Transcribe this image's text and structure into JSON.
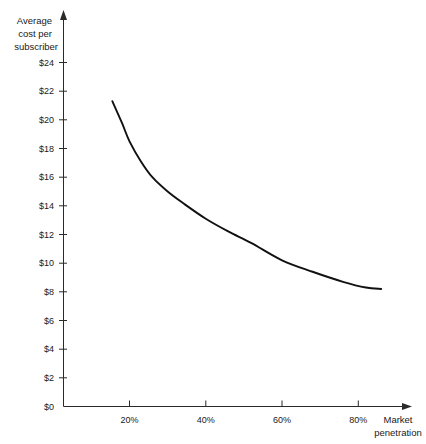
{
  "chart_data": {
    "type": "line",
    "title": "",
    "xlabel": "Market penetration",
    "ylabel": "Average cost per subscriber",
    "ylabel_lines": [
      "Average",
      "cost per",
      "subscriber"
    ],
    "xlabel_lines": [
      "Market",
      "penetration"
    ],
    "xlim": [
      0,
      90
    ],
    "ylim": [
      0,
      24
    ],
    "grid": false,
    "legend": null,
    "x_tick_labels": [
      "20%",
      "40%",
      "60%",
      "80%"
    ],
    "x_tick_values": [
      20,
      40,
      60,
      80
    ],
    "y_tick_labels": [
      "$0",
      "$2",
      "$4",
      "$6",
      "$8",
      "$10",
      "$12",
      "$14",
      "$16",
      "$18",
      "$20",
      "$22",
      "$24"
    ],
    "y_tick_values": [
      0,
      2,
      4,
      6,
      8,
      10,
      12,
      14,
      16,
      18,
      20,
      22,
      24
    ],
    "series": [
      {
        "name": "Average cost per subscriber",
        "x": [
          15.5,
          18,
          20,
          23,
          26,
          30,
          34,
          40,
          46,
          52,
          60,
          68,
          76,
          82,
          86
        ],
        "values": [
          21.3,
          19.8,
          18.5,
          17.1,
          16.0,
          15.0,
          14.2,
          13.1,
          12.2,
          11.4,
          10.2,
          9.4,
          8.7,
          8.3,
          8.2
        ]
      }
    ],
    "colors": {
      "curve": "#111111",
      "axis": "#2a2a2a",
      "text": "#1a1a1a",
      "background": "#ffffff"
    }
  }
}
